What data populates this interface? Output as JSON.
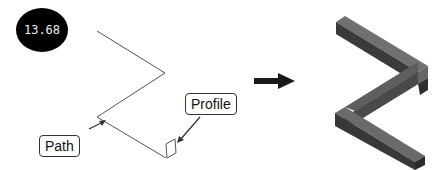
{
  "badge": {
    "value": "13.68"
  },
  "callouts": {
    "path_label": "Path",
    "profile_label": "Profile"
  },
  "arrow": {
    "direction": "right",
    "meaning": "sweep-result"
  },
  "colors": {
    "line": "#555555",
    "solid_top": "#6f6f6f",
    "solid_side": "#3c3c3c",
    "solid_dark": "#2a2a2a",
    "arrow": "#1a1a1a"
  }
}
